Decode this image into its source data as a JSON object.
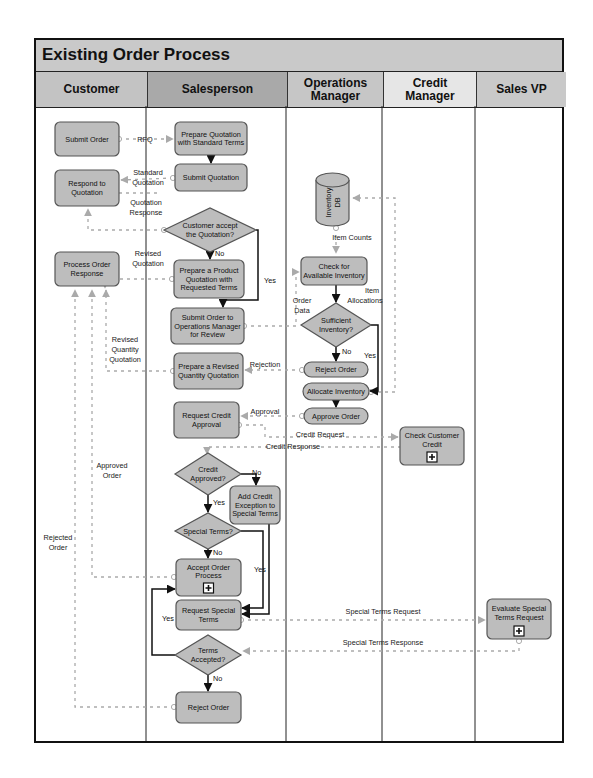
{
  "title": "Existing Order Process",
  "colors": {
    "header_bg": "#c9c9c9",
    "lane_customer": "#c3c3c3",
    "lane_salesperson": "#a9a9a9",
    "lane_operations": "#c6c6c6",
    "lane_credit": "#e6e6e6",
    "lane_salesvp": "#c9c9c9",
    "task_fill": "#bdbdbd",
    "task_stroke": "#555555",
    "message_flow": "#aaaaaa",
    "sequence_flow": "#111111"
  },
  "lanes": [
    {
      "id": "customer",
      "label": "Customer",
      "x": 0,
      "w": 112
    },
    {
      "id": "salesperson",
      "label": "Salesperson",
      "x": 112,
      "w": 140
    },
    {
      "id": "operations",
      "label": "Operations\nManager",
      "x": 252,
      "w": 96
    },
    {
      "id": "credit",
      "label": "Credit\nManager",
      "x": 348,
      "w": 93
    },
    {
      "id": "salesvp",
      "label": "Sales VP",
      "x": 441,
      "w": 89
    }
  ],
  "tasks": [
    {
      "id": "submit-order",
      "lane": "customer",
      "lines": [
        "Submit Order"
      ],
      "x": 55,
      "y": 122,
      "w": 64,
      "h": 34
    },
    {
      "id": "respond-to-quotation",
      "lane": "customer",
      "lines": [
        "Respond to",
        "Quotation"
      ],
      "x": 55,
      "y": 170,
      "w": 64,
      "h": 36
    },
    {
      "id": "process-order-response",
      "lane": "customer",
      "lines": [
        "Process Order",
        "Response"
      ],
      "x": 55,
      "y": 252,
      "w": 64,
      "h": 34
    },
    {
      "id": "prepare-quotation",
      "lane": "salesperson",
      "lines": [
        "Prepare Quotation",
        "with Standard Terms"
      ],
      "x": 175,
      "y": 122,
      "w": 72,
      "h": 33
    },
    {
      "id": "submit-quotation",
      "lane": "salesperson",
      "lines": [
        "Submit Quotation"
      ],
      "x": 175,
      "y": 164,
      "w": 72,
      "h": 27
    },
    {
      "id": "prepare-product-quotation",
      "lane": "salesperson",
      "lines": [
        "Prepare a Product",
        "Quotation with",
        "Requested Terms"
      ],
      "x": 174,
      "y": 260,
      "w": 70,
      "h": 38
    },
    {
      "id": "submit-order-to-ops",
      "lane": "salesperson",
      "lines": [
        "Submit Order to",
        "Operations Manager",
        "for Review"
      ],
      "x": 171,
      "y": 308,
      "w": 73,
      "h": 36
    },
    {
      "id": "prepare-revised-quantity",
      "lane": "salesperson",
      "lines": [
        "Prepare a Revised",
        "Quantity Quotation"
      ],
      "x": 174,
      "y": 353,
      "w": 69,
      "h": 36
    },
    {
      "id": "request-credit-approval",
      "lane": "salesperson",
      "lines": [
        "Request Credit",
        "Approval"
      ],
      "x": 174,
      "y": 402,
      "w": 65,
      "h": 36
    },
    {
      "id": "add-credit-exception",
      "lane": "salesperson",
      "lines": [
        "Add Credit",
        "Exception to",
        "Special Terms"
      ],
      "x": 230,
      "y": 486,
      "w": 50,
      "h": 38
    },
    {
      "id": "accept-order-process",
      "lane": "salesperson",
      "lines": [
        "Accept Order",
        "Process"
      ],
      "x": 176,
      "y": 559,
      "w": 65,
      "h": 37,
      "subprocess": true
    },
    {
      "id": "request-special-terms",
      "lane": "salesperson",
      "lines": [
        "Request Special",
        "Terms"
      ],
      "x": 176,
      "y": 600,
      "w": 65,
      "h": 30
    },
    {
      "id": "reject-order-sales",
      "lane": "salesperson",
      "lines": [
        "Reject Order"
      ],
      "x": 176,
      "y": 692,
      "w": 65,
      "h": 31
    },
    {
      "id": "check-inventory",
      "lane": "operations",
      "lines": [
        "Check for",
        "Available Inventory"
      ],
      "x": 301,
      "y": 257,
      "w": 66,
      "h": 28
    },
    {
      "id": "reject-order-ops",
      "lane": "operations",
      "lines": [
        "Reject Order"
      ],
      "x": 304,
      "y": 362,
      "w": 64,
      "h": 15,
      "pill": true
    },
    {
      "id": "allocate-inventory",
      "lane": "operations",
      "lines": [
        "Allocate Inventory"
      ],
      "x": 303,
      "y": 383,
      "w": 66,
      "h": 17,
      "pill": true
    },
    {
      "id": "approve-order",
      "lane": "operations",
      "lines": [
        "Approve Order"
      ],
      "x": 304,
      "y": 408,
      "w": 64,
      "h": 16,
      "pill": true
    },
    {
      "id": "check-customer-credit",
      "lane": "credit",
      "lines": [
        "Check Customer",
        "Credit"
      ],
      "x": 400,
      "y": 427,
      "w": 64,
      "h": 38,
      "subprocess": true
    },
    {
      "id": "evaluate-special-terms",
      "lane": "salesvp",
      "lines": [
        "Evaluate Special",
        "Terms Request"
      ],
      "x": 487,
      "y": 599,
      "w": 64,
      "h": 40,
      "subprocess": true
    }
  ],
  "gateways": [
    {
      "id": "customer-accept",
      "lines": [
        "Customer accept",
        "the Quotation?"
      ],
      "cx": 210,
      "cy": 230,
      "rx": 46,
      "ry": 22
    },
    {
      "id": "sufficient-inventory",
      "lines": [
        "Sufficient",
        "Inventory?"
      ],
      "cx": 336,
      "cy": 325,
      "rx": 35,
      "ry": 22
    },
    {
      "id": "credit-approved",
      "lines": [
        "Credit",
        "Approved?"
      ],
      "cx": 208,
      "cy": 474,
      "rx": 33,
      "ry": 21
    },
    {
      "id": "special-terms",
      "lines": [
        "Special Terms?"
      ],
      "cx": 208,
      "cy": 531,
      "rx": 33,
      "ry": 18
    },
    {
      "id": "terms-accepted",
      "lines": [
        "Terms",
        "Accepted?"
      ],
      "cx": 208,
      "cy": 655,
      "rx": 33,
      "ry": 20
    }
  ],
  "datastore": {
    "id": "inventory-db",
    "label": "Inventory\nDB",
    "x": 316,
    "y": 173,
    "w": 33,
    "h": 53
  },
  "message_labels": [
    {
      "text": "RFQ",
      "x": 145,
      "y": 142
    },
    {
      "text": "Standard",
      "x": 148,
      "y": 175
    },
    {
      "text": "Quotation",
      "x": 148,
      "y": 185
    },
    {
      "text": "Quotation",
      "x": 146,
      "y": 205
    },
    {
      "text": "Response",
      "x": 146,
      "y": 215
    },
    {
      "text": "Revised",
      "x": 148,
      "y": 256
    },
    {
      "text": "Quotation",
      "x": 148,
      "y": 266
    },
    {
      "text": "Revised",
      "x": 125,
      "y": 342
    },
    {
      "text": "Quantity",
      "x": 125,
      "y": 352
    },
    {
      "text": "Quotation",
      "x": 125,
      "y": 362
    },
    {
      "text": "Rejection",
      "x": 265,
      "y": 367
    },
    {
      "text": "Approval",
      "x": 265,
      "y": 414
    },
    {
      "text": "Credit Request",
      "x": 320,
      "y": 437
    },
    {
      "text": "Credit Response",
      "x": 293,
      "y": 449
    },
    {
      "text": "Item Counts",
      "x": 352,
      "y": 240
    },
    {
      "text": "Order",
      "x": 302,
      "y": 303
    },
    {
      "text": "Data",
      "x": 302,
      "y": 313
    },
    {
      "text": "Item",
      "x": 372,
      "y": 293
    },
    {
      "text": "Allocations",
      "x": 365,
      "y": 303
    },
    {
      "text": "Approved",
      "x": 112,
      "y": 468
    },
    {
      "text": "Order",
      "x": 112,
      "y": 478
    },
    {
      "text": "Rejected",
      "x": 58,
      "y": 540
    },
    {
      "text": "Order",
      "x": 58,
      "y": 550
    },
    {
      "text": "Special Terms Request",
      "x": 383,
      "y": 614
    },
    {
      "text": "Special Terms Response",
      "x": 383,
      "y": 645
    }
  ],
  "flow_labels": [
    {
      "text": "No",
      "x": 215,
      "y": 256
    },
    {
      "text": "Yes",
      "x": 264,
      "y": 283
    },
    {
      "text": "No",
      "x": 342,
      "y": 354
    },
    {
      "text": "Yes",
      "x": 364,
      "y": 358
    },
    {
      "text": "No",
      "x": 252,
      "y": 475
    },
    {
      "text": "Yes",
      "x": 213,
      "y": 505
    },
    {
      "text": "No",
      "x": 213,
      "y": 555
    },
    {
      "text": "Yes",
      "x": 254,
      "y": 572
    },
    {
      "text": "Yes",
      "x": 162,
      "y": 621
    },
    {
      "text": "No",
      "x": 213,
      "y": 681
    }
  ]
}
